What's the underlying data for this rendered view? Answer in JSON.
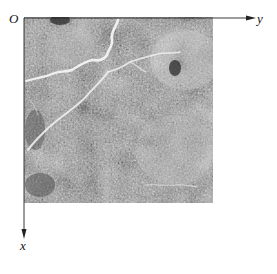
{
  "figure": {
    "origin_label": "O",
    "y_axis_label": "y",
    "x_axis_label": "x",
    "axes": {
      "origin_px": [
        24,
        18
      ],
      "y_axis_end_px": [
        253,
        18
      ],
      "x_axis_end_px": [
        24,
        236
      ],
      "y_axis_direction": "right",
      "x_axis_direction": "down"
    },
    "image": {
      "description": "grayscale textured surface image with bright crack/vein features",
      "bounds_px": {
        "left": 24,
        "top": 17,
        "right": 213,
        "bottom": 203
      },
      "colors": {
        "background_mid": "#8a8a8a",
        "dark": "#3a3a3a",
        "bright": "#e8e8e8"
      }
    },
    "colors": {
      "axis": "#222222",
      "page_background": "#ffffff"
    }
  }
}
